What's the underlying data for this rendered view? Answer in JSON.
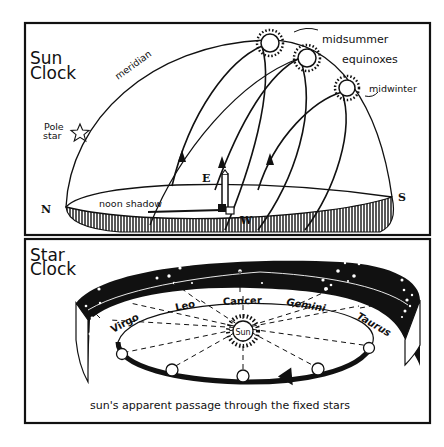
{
  "sun_clock": {
    "title_line1": "Sun",
    "title_line2": "Clock",
    "labels": {
      "meridian": "meridian",
      "pole_star_line1": "Pole",
      "pole_star_line2": "star",
      "midsummer": "midsummer",
      "equinoxes": "equinoxes",
      "midwinter": "midwinter",
      "noon_shadow": "noon shadow",
      "north": "N",
      "south": "S",
      "east": "E",
      "west": "W"
    }
  },
  "star_clock": {
    "title_line1": "Star",
    "title_line2": "Clock",
    "constellations": [
      "Virgo",
      "Leo",
      "Cancer",
      "Gemini",
      "Taurus"
    ],
    "sun_label": "Sun",
    "caption": "sun's apparent passage through the fixed stars"
  },
  "colors": {
    "ink": "#111111",
    "paper": "#ffffff"
  }
}
